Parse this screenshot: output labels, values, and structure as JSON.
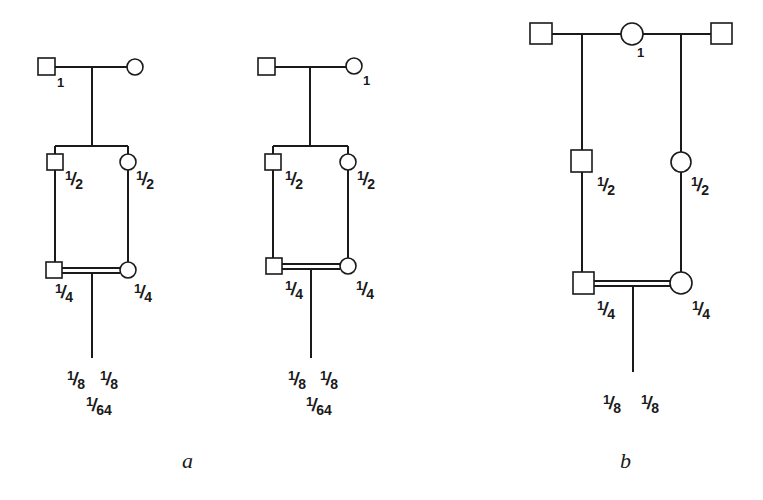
{
  "figure": {
    "panels": [
      {
        "id": "a",
        "caption": "a",
        "pedigrees": [
          {
            "ancestors": {
              "male_label": "1",
              "female_label": ""
            },
            "generation_2": {
              "male_label": {
                "num": "1",
                "den": "2"
              },
              "female_label": {
                "num": "1",
                "den": "2"
              }
            },
            "generation_3": {
              "male_label": {
                "num": "1",
                "den": "4"
              },
              "female_label": {
                "num": "1",
                "den": "4"
              }
            },
            "offspring": {
              "left": {
                "num": "1",
                "den": "8"
              },
              "right": {
                "num": "1",
                "den": "8"
              },
              "product": {
                "num": "1",
                "den": "64"
              }
            }
          },
          {
            "ancestors": {
              "male_label": "",
              "female_label": "1"
            },
            "generation_2": {
              "male_label": {
                "num": "1",
                "den": "2"
              },
              "female_label": {
                "num": "1",
                "den": "2"
              }
            },
            "generation_3": {
              "male_label": {
                "num": "1",
                "den": "4"
              },
              "female_label": {
                "num": "1",
                "den": "4"
              }
            },
            "offspring": {
              "left": {
                "num": "1",
                "den": "8"
              },
              "right": {
                "num": "1",
                "den": "8"
              },
              "product": {
                "num": "1",
                "den": "64"
              }
            }
          }
        ]
      },
      {
        "id": "b",
        "caption": "b",
        "pedigree": {
          "ancestors": {
            "common_female_label": "1"
          },
          "generation_2": {
            "male_label": {
              "num": "1",
              "den": "2"
            },
            "female_label": {
              "num": "1",
              "den": "2"
            }
          },
          "generation_3": {
            "male_label": {
              "num": "1",
              "den": "4"
            },
            "female_label": {
              "num": "1",
              "den": "4"
            }
          },
          "offspring": {
            "left": {
              "num": "1",
              "den": "8"
            },
            "right": {
              "num": "1",
              "den": "8"
            }
          }
        }
      }
    ],
    "legend_symbols": {
      "male": "square",
      "female": "circle",
      "consanguineous_mating": "double-line"
    }
  }
}
